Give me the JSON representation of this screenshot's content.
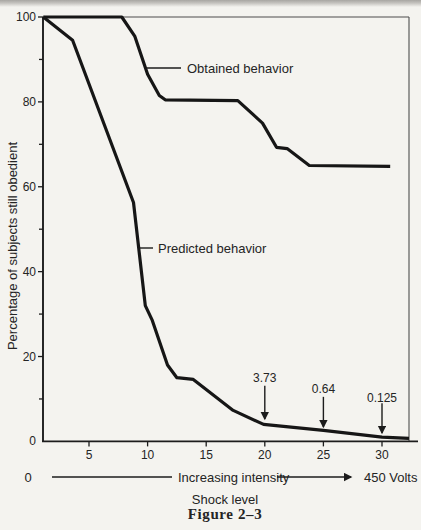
{
  "chart_data": {
    "type": "line",
    "title": "",
    "ylabel": "Percentage of subjects still obedient",
    "xlabel": "Shock level",
    "caption": "Figure 2–3",
    "grid": false,
    "legend_position": "inline-labels",
    "ylim": [
      0,
      100
    ],
    "xlim": [
      1,
      32.3
    ],
    "x_ticks": [
      5,
      10,
      15,
      20,
      25,
      30
    ],
    "y_ticks_major": [
      0,
      20,
      40,
      60,
      80,
      100
    ],
    "y_ticks_minor": [
      10,
      30,
      50,
      70,
      90
    ],
    "series": [
      {
        "name": "Obtained behavior",
        "points": [
          [
            1.1,
            100
          ],
          [
            7.8,
            100
          ],
          [
            8.9,
            95.5
          ],
          [
            10,
            86.5
          ],
          [
            11,
            81.5
          ],
          [
            11.5,
            80.5
          ],
          [
            17.7,
            80.3
          ],
          [
            19.8,
            75
          ],
          [
            21,
            69.3
          ],
          [
            21.9,
            69
          ],
          [
            23.8,
            65
          ],
          [
            30.7,
            64.8
          ]
        ]
      },
      {
        "name": "Predicted behavior",
        "points": [
          [
            1.1,
            100
          ],
          [
            3.6,
            94.5
          ],
          [
            8.8,
            56.3
          ],
          [
            9.8,
            32
          ],
          [
            10.4,
            28.5
          ],
          [
            11.7,
            18
          ],
          [
            12.5,
            15
          ],
          [
            13.9,
            14.6
          ],
          [
            17.3,
            7.3
          ],
          [
            19.9,
            4
          ],
          [
            25,
            2.6
          ],
          [
            30,
            1
          ],
          [
            32.3,
            0.7
          ]
        ]
      }
    ],
    "annotations": [
      {
        "text": "3.73",
        "x": 20,
        "label_y": 14.0,
        "arrow_from_y": 13.1,
        "arrow_to_y": 5.3
      },
      {
        "text": "0.64",
        "x": 25,
        "label_y": 11.4,
        "arrow_from_y": 10.5,
        "arrow_to_y": 3.4
      },
      {
        "text": "0.125",
        "x": 30,
        "label_y": 9.3,
        "arrow_from_y": 9.0,
        "arrow_to_y": 2.0
      }
    ],
    "x_axis_annotation": {
      "start": "0",
      "label": "Increasing intensity",
      "end": "450 Volts"
    },
    "ink_color": "#1c1c1c"
  }
}
